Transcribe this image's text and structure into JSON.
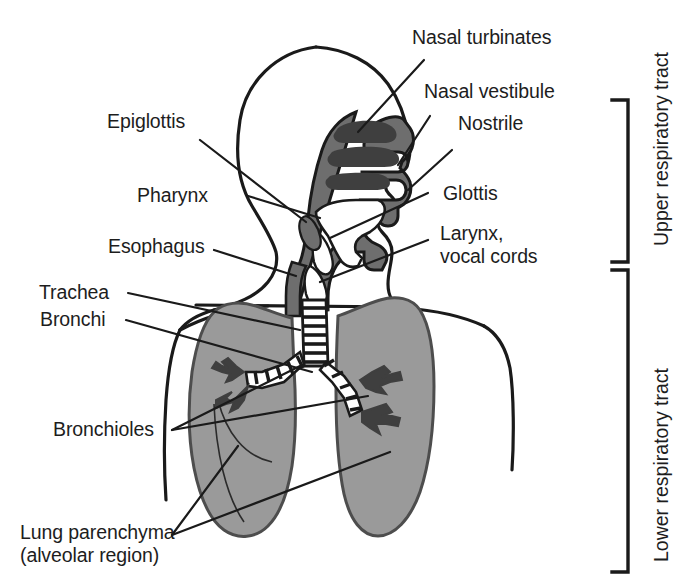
{
  "figure": {
    "colors": {
      "background": "#ffffff",
      "outline": "#1a1a1a",
      "lung_fill": "#9a9a9a",
      "airway_fill": "#6e6e6e",
      "mucosa_dark": "#4a4a4a",
      "text": "#1d1d1d"
    }
  },
  "labels": {
    "nasal_turbinates": "Nasal turbinates",
    "nasal_vestibule": "Nasal vestibule",
    "nostrile": "Nostrile",
    "epiglottis": "Epiglottis",
    "pharynx": "Pharynx",
    "esophagus": "Esophagus",
    "glottis": "Glottis",
    "larynx_line1": "Larynx,",
    "larynx_line2": "vocal cords",
    "trachea": "Trachea",
    "bronchi": "Bronchi",
    "bronchioles": "Bronchioles",
    "lung_parenchyma_line1": "Lung parenchyma",
    "lung_parenchyma_line2": "(alveolar region)"
  },
  "brackets": {
    "upper": "Upper respiratory tract",
    "lower": "Lower respiratory tract"
  }
}
